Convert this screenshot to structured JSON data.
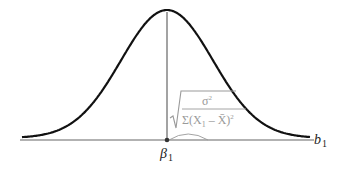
{
  "diagram": {
    "type": "normal-distribution-curve",
    "curve": {
      "mean_x": 167,
      "peak_y": 12,
      "baseline_y": 140,
      "x_start": 22,
      "x_end": 310,
      "sigma_px": 46,
      "color": "#111111"
    },
    "axis": {
      "color": "#666666",
      "label": "b",
      "label_sub": "1"
    },
    "mean_marker": {
      "label": "β",
      "label_sub": "1",
      "color": "#333333"
    },
    "formula": {
      "description": "standard error of b1",
      "numerator": "σ",
      "numerator_exp": "2",
      "denominator": "Σ(X",
      "denominator_sub": "1",
      "denominator_rest": " – X̄)",
      "denominator_exp": "2",
      "color": "#9a9a9a"
    }
  }
}
